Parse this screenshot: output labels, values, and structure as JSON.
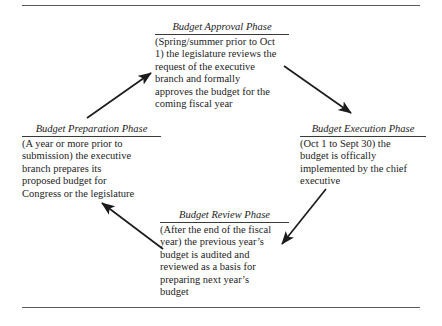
{
  "figure": {
    "name": "budget-cycle-diagram",
    "direction": "clockwise",
    "text_color": "#1c1c1c",
    "rule_color": "#5a5a5a",
    "background": "#ffffff"
  },
  "phases": [
    {
      "id": "approval",
      "title": "Budget Approval Phase",
      "lines": [
        "(Spring/summer prior to Oct",
        "1) the legislature reviews the",
        "request of the executive",
        "branch and formally",
        "approves the budget for the",
        "coming fiscal year"
      ]
    },
    {
      "id": "execution",
      "title": "Budget Execution Phase",
      "lines": [
        "(Oct 1 to Sept 30) the",
        "budget is offically",
        "implemented by the chief",
        "executive"
      ]
    },
    {
      "id": "review",
      "title": "Budget Review Phase",
      "lines": [
        "(After the end of the fiscal",
        "year) the previous year’s",
        "budget is audited and",
        "reviewed as a basis for",
        "preparing next year’s",
        "budget"
      ]
    },
    {
      "id": "preparation",
      "title": "Budget Preparation Phase",
      "lines": [
        "(A year or more prior to",
        "submission) the executive",
        "branch prepares its",
        "proposed budget for",
        "Congress or the legislature"
      ]
    }
  ],
  "arrows": [
    {
      "id": "preparation-to-approval",
      "from": "preparation",
      "to": "approval"
    },
    {
      "id": "approval-to-execution",
      "from": "approval",
      "to": "execution"
    },
    {
      "id": "execution-to-review",
      "from": "execution",
      "to": "review"
    },
    {
      "id": "review-to-preparation",
      "from": "review",
      "to": "preparation"
    }
  ]
}
